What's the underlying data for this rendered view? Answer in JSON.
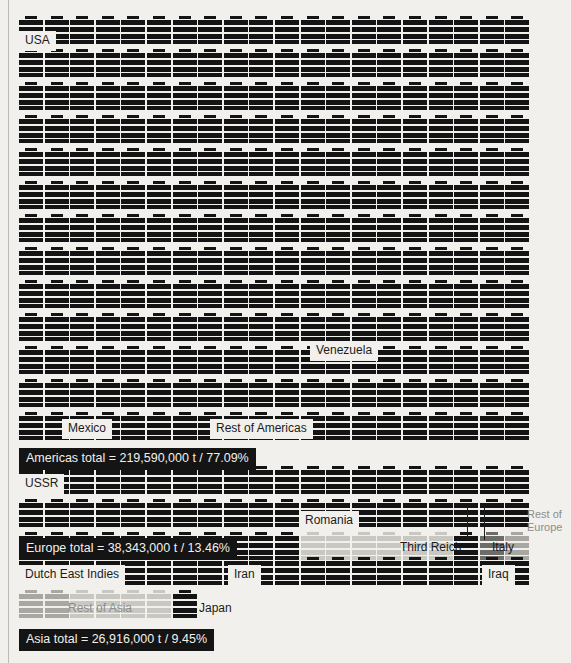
{
  "chart_data": {
    "type": "pictogram",
    "title": "",
    "unit_label": "barrel icon = unit of crude oil production",
    "colors": {
      "background": "#f2f0ec",
      "ink": "#141414",
      "allied_dark": "#141414",
      "axis_dark": "#1b1b1b",
      "gray_light": "#c9c7c2",
      "gray_mid": "#a9a7a2",
      "gray_dark": "#6e6c68",
      "total_bar_bg": "#141414",
      "total_bar_text": "#f2f0ec"
    },
    "regions": [
      {
        "name": "Americas",
        "total_label": "Americas total = 219,590,000 t  / 77.09%",
        "total_tonnes": 219590000,
        "percent": 77.09,
        "rows": 13,
        "columns": 20,
        "icon_count": 259,
        "countries": [
          {
            "label": "USA",
            "shade": "dark"
          },
          {
            "label": "Venezuela",
            "shade": "dark"
          },
          {
            "label": "Mexico",
            "shade": "dark"
          },
          {
            "label": "Rest of Americas",
            "shade": "dark"
          }
        ]
      },
      {
        "name": "Europe",
        "total_label": "Europe total = 38,343,000 t  / 13.46%",
        "total_tonnes": 38343000,
        "percent": 13.46,
        "rows": 3,
        "columns": 20,
        "icon_count": 46,
        "countries": [
          {
            "label": "USSR",
            "shade": "dark"
          },
          {
            "label": "Romania",
            "shade": "light"
          },
          {
            "label": "Third Reich",
            "shade": "dark"
          },
          {
            "label": "Italy",
            "shade": "gray-dark"
          },
          {
            "label": "Rest of Europe",
            "shade": "mid"
          }
        ]
      },
      {
        "name": "Asia",
        "total_label": "Asia total = 26,916,000 t  / 9.45%",
        "total_tonnes": 26916000,
        "percent": 9.45,
        "rows": 2,
        "columns": 20,
        "icon_count": 28,
        "countries": [
          {
            "label": "Dutch East Indies",
            "shade": "dark"
          },
          {
            "label": "Iran",
            "shade": "dark"
          },
          {
            "label": "Iraq",
            "shade": "dark"
          },
          {
            "label": "Rest of Asia",
            "shade": "light"
          },
          {
            "label": "Japan",
            "shade": "dark"
          }
        ]
      }
    ],
    "labels": [
      "USA",
      "Venezuela",
      "Mexico",
      "Rest of Americas",
      "USSR",
      "Romania",
      "Third Reich",
      "Italy",
      "Rest of Europe",
      "Dutch East Indies",
      "Iran",
      "Iraq",
      "Rest of Asia",
      "Japan"
    ]
  },
  "labels": {
    "usa": "USA",
    "venezuela": "Venezuela",
    "mexico": "Mexico",
    "rest_of_americas": "Rest of Americas",
    "americas_total": "Americas total = 219,590,000 t  / 77.09%",
    "ussr": "USSR",
    "romania": "Romania",
    "third_reich": "Third Reich",
    "italy": "Italy",
    "rest_of_europe_1": "Rest of",
    "rest_of_europe_2": "Europe",
    "europe_total": "Europe total = 38,343,000 t  / 13.46%",
    "dutch_east_indies": "Dutch East Indies",
    "iran": "Iran",
    "iraq": "Iraq",
    "rest_of_asia": "Rest of Asia",
    "japan": "Japan",
    "asia_total": "Asia total = 26,916,000 t  / 9.45%"
  }
}
